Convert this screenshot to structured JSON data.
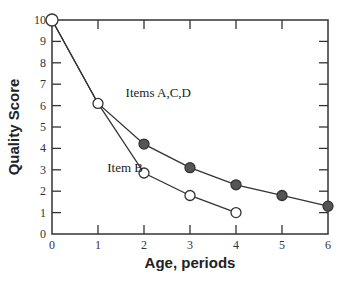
{
  "chart_data": {
    "type": "line",
    "title": "",
    "xlabel": "Age, periods",
    "ylabel": "Quality Score",
    "xlim": [
      0,
      6
    ],
    "ylim": [
      0,
      10
    ],
    "x_ticks": [
      0,
      1,
      2,
      3,
      4,
      5,
      6
    ],
    "y_ticks": [
      0,
      1,
      2,
      3,
      4,
      5,
      6,
      7,
      8,
      9,
      10
    ],
    "grid": false,
    "legend": "none (inline annotations)",
    "series": [
      {
        "name": "Items A,C,D",
        "marker": "filled-circle",
        "x": [
          0,
          1,
          2,
          3,
          4,
          5,
          6
        ],
        "y": [
          10,
          6.1,
          4.2,
          3.1,
          2.3,
          1.8,
          1.3
        ]
      },
      {
        "name": "Item B",
        "marker": "open-circle",
        "x": [
          0,
          1,
          2,
          3,
          4
        ],
        "y": [
          10,
          6.1,
          2.85,
          1.8,
          1.0
        ]
      }
    ],
    "annotations": [
      {
        "text": "Items A,C,D",
        "x": 1.6,
        "y": 6.6
      },
      {
        "text": "Item B",
        "x": 1.2,
        "y": 3.1
      }
    ]
  },
  "colors": {
    "axis": "#333333",
    "line": "#333333",
    "filled_marker": "#555555",
    "open_marker_fill": "#ffffff"
  }
}
